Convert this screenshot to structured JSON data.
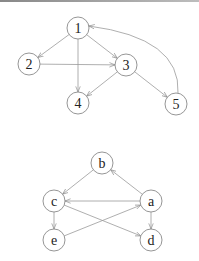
{
  "diagrams": [
    {
      "name": "numeric-digraph",
      "nodes": [
        {
          "id": "1",
          "label": "1",
          "x": 78,
          "y": 28
        },
        {
          "id": "2",
          "label": "2",
          "x": 29,
          "y": 64
        },
        {
          "id": "3",
          "label": "3",
          "x": 126,
          "y": 65
        },
        {
          "id": "4",
          "label": "4",
          "x": 78,
          "y": 103
        },
        {
          "id": "5",
          "label": "5",
          "x": 176,
          "y": 104
        }
      ],
      "edges": [
        {
          "from": "1",
          "to": "2"
        },
        {
          "from": "1",
          "to": "3"
        },
        {
          "from": "1",
          "to": "4"
        },
        {
          "from": "2",
          "to": "3"
        },
        {
          "from": "3",
          "to": "4"
        },
        {
          "from": "3",
          "to": "5"
        },
        {
          "from": "5",
          "to": "1",
          "curved": true
        }
      ]
    },
    {
      "name": "letter-digraph",
      "nodes": [
        {
          "id": "b",
          "label": "b",
          "x": 102,
          "y": 163
        },
        {
          "id": "c",
          "label": "c",
          "x": 54,
          "y": 201
        },
        {
          "id": "a",
          "label": "a",
          "x": 151,
          "y": 201
        },
        {
          "id": "e",
          "label": "e",
          "x": 54,
          "y": 240
        },
        {
          "id": "d",
          "label": "d",
          "x": 151,
          "y": 240
        }
      ],
      "edges": [
        {
          "from": "a",
          "to": "b"
        },
        {
          "from": "b",
          "to": "c"
        },
        {
          "from": "a",
          "to": "c"
        },
        {
          "from": "c",
          "to": "e"
        },
        {
          "from": "c",
          "to": "d"
        },
        {
          "from": "e",
          "to": "a"
        },
        {
          "from": "a",
          "to": "d"
        }
      ]
    }
  ],
  "style": {
    "node_radius": 11,
    "edge_color": "#9a9a9a",
    "node_stroke": "#8a8a8a"
  }
}
